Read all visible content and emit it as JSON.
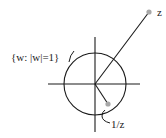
{
  "diagram": {
    "labels": {
      "circle": "{w: |w|=1}",
      "z": "z",
      "inverse": "1/z"
    },
    "colors": {
      "line": "#1a1a1a",
      "point": "#a8a8a8",
      "text": "#222222",
      "background": "#ffffff"
    },
    "geometry": {
      "center": [
        95,
        84
      ],
      "radius": 31,
      "point_z": [
        149,
        12
      ],
      "point_inverse": [
        108,
        104
      ]
    }
  }
}
